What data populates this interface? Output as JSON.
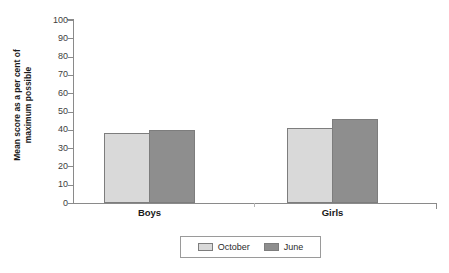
{
  "chart_data": {
    "type": "bar",
    "title": "",
    "xlabel": "",
    "ylabel": "Mean score as a per cent of maximum possible",
    "ylabel_line1": "Mean score as a per cent of",
    "ylabel_line2": "maximum possible",
    "categories": [
      "Boys",
      "Girls"
    ],
    "series": [
      {
        "name": "October",
        "color": "#d9d9d9",
        "values": [
          38,
          41
        ]
      },
      {
        "name": "June",
        "color": "#8e8e8e",
        "values": [
          40,
          46
        ]
      }
    ],
    "ylim": [
      0,
      100
    ],
    "yticks": [
      100,
      90,
      80,
      70,
      60,
      50,
      40,
      30,
      20,
      10,
      0
    ],
    "ytick_labels": [
      "100",
      "90",
      "80",
      "70",
      "60",
      "50",
      "40",
      "30",
      "20",
      "10",
      "0"
    ],
    "grid": false,
    "legend_position": "bottom",
    "legend_entries": [
      "October",
      "June"
    ],
    "axis_color": "#8a8a8a",
    "bar_border_color": "#7d7d7d"
  },
  "legend": {
    "entries": [
      {
        "label": "October",
        "swatch": "october"
      },
      {
        "label": "June",
        "swatch": "june"
      }
    ]
  }
}
